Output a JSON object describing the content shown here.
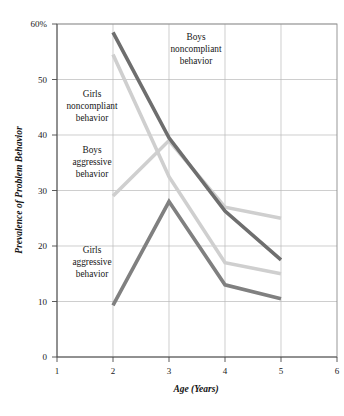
{
  "chart_data": {
    "type": "line",
    "title": "",
    "xlabel": "Age (Years)",
    "ylabel": "Prevalence of Problem Behavior",
    "x": [
      2,
      3,
      4,
      5
    ],
    "xlim": [
      1,
      6
    ],
    "ylim": [
      0,
      60
    ],
    "xticks": [
      "1",
      "2",
      "3",
      "4",
      "5",
      "6"
    ],
    "yticks": [
      "0",
      "10",
      "20",
      "30",
      "40",
      "50",
      "60%"
    ],
    "grid": "both",
    "legend": "inline-annotations",
    "series": [
      {
        "name": "Boys noncompliant behavior",
        "color": "#6e6e6e",
        "values": [
          58.5,
          39.5,
          26.3,
          17.5
        ]
      },
      {
        "name": "Girls noncompliant behavior",
        "color": "#cfcfcf",
        "values": [
          54.5,
          32.5,
          17.0,
          15.0
        ]
      },
      {
        "name": "Boys aggressive behavior",
        "color": "#cfcfcf",
        "values": [
          29.0,
          39.0,
          27.0,
          25.0
        ]
      },
      {
        "name": "Girls aggressive behavior",
        "color": "#808080",
        "values": [
          9.3,
          28.0,
          13.0,
          10.5
        ]
      }
    ],
    "annotations": [
      {
        "id": "boys-noncompliant",
        "lines": [
          "Boys",
          "noncompliant",
          "behavior"
        ]
      },
      {
        "id": "girls-noncompliant",
        "lines": [
          "Girls",
          "noncompliant",
          "behavior"
        ]
      },
      {
        "id": "boys-aggressive",
        "lines": [
          "Boys",
          "aggressive",
          "behavior"
        ]
      },
      {
        "id": "girls-aggressive",
        "lines": [
          "Girls",
          "aggressive",
          "behavior"
        ]
      }
    ]
  }
}
